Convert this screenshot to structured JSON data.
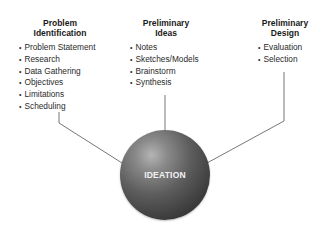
{
  "columns": [
    {
      "title": "Problem Identification",
      "title_lines": [
        "Problem",
        "Identification"
      ],
      "items": [
        "Problem Statement",
        "Research",
        "Data Gathering",
        "Objectives",
        "Limitations",
        "Scheduling"
      ]
    },
    {
      "title": "Preliminary Ideas",
      "title_lines": [
        "Preliminary",
        "Ideas"
      ],
      "items": [
        "Notes",
        "Sketches/Models",
        "Brainstorm",
        "Synthesis"
      ]
    },
    {
      "title": "Preliminary Design",
      "title_lines": [
        "Preliminary",
        "Design"
      ],
      "items": [
        "Evaluation",
        "Selection"
      ]
    }
  ],
  "center": {
    "label": "IDEATION"
  },
  "colors": {
    "line": "#555555",
    "sphere_dark": "#2a2a2a",
    "sphere_light": "#b4b4b4",
    "text": "#222222"
  }
}
